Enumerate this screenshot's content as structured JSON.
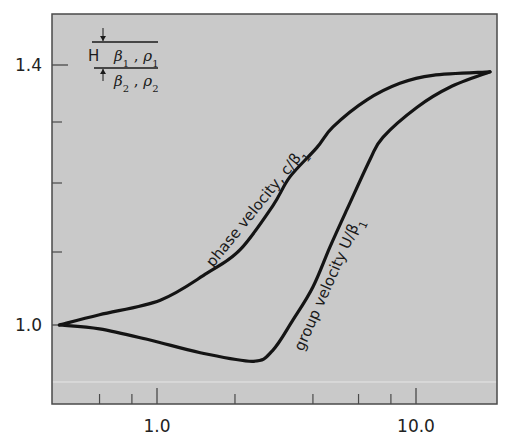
{
  "chart_data": {
    "type": "line",
    "title": "",
    "xlabel": "",
    "ylabel": "",
    "x_scale": "log",
    "xlim": [
      0.4,
      20
    ],
    "ylim": [
      0.9,
      1.45
    ],
    "grid": false,
    "legend": null,
    "x_ticks": {
      "major": [
        {
          "value": 1.0,
          "label": "1.0"
        },
        {
          "value": 10.0,
          "label": "10.0"
        }
      ],
      "minor": [
        0.6,
        0.8,
        2,
        4,
        6,
        8
      ]
    },
    "y_ticks": {
      "major": [
        {
          "value": 1.0,
          "label": "1.0"
        },
        {
          "value": 1.4,
          "label": "1.4"
        }
      ],
      "minor": [
        1.1,
        1.2,
        1.3
      ]
    },
    "series": [
      {
        "name": "phase velocity, c/β1",
        "label": "phase velocity, c/β₁",
        "x": [
          0.42,
          0.6,
          1.03,
          1.56,
          2.09,
          2.8,
          3.26,
          4.14,
          4.78,
          6.46,
          8.67,
          11.6,
          19.3
        ],
        "y": [
          1.0,
          1.014,
          1.034,
          1.071,
          1.103,
          1.167,
          1.21,
          1.258,
          1.292,
          1.339,
          1.368,
          1.382,
          1.388
        ]
      },
      {
        "name": "group velocity U/β1",
        "label": "group velocity U/β₁",
        "x": [
          0.42,
          0.6,
          0.94,
          1.47,
          2.35,
          2.8,
          3.35,
          4.0,
          4.65,
          5.42,
          6.64,
          7.45,
          10.1,
          13.5,
          19.3
        ],
        "y": [
          1.0,
          0.995,
          0.981,
          0.965,
          0.954,
          0.968,
          1.007,
          1.052,
          1.107,
          1.162,
          1.238,
          1.275,
          1.326,
          1.361,
          1.388
        ]
      }
    ],
    "annotations": [
      {
        "text": "phase velocity, c/β₁",
        "attached_to": "phase velocity, c/β1"
      },
      {
        "text": "group velocity U/β₁",
        "attached_to": "group velocity U/β1"
      }
    ],
    "inset": {
      "description": "layer over half-space",
      "thickness_label": "H",
      "upper_layer": "β₁ , ρ₁",
      "lower_halfspace": "β₂ , ρ₂"
    }
  },
  "colors": {
    "plot_background": "#c9c9c9",
    "frame": "#4a4a4a",
    "curve": "#141414",
    "text": "#1a1a1a"
  },
  "labels": {
    "phase": "phase velocity, c/β",
    "phase_sub": "1",
    "group": "group velocity U/β",
    "group_sub": "1",
    "inset_H": "H",
    "inset_b1": "β",
    "inset_b1_sub": "1",
    "inset_sep1": " , ",
    "inset_r1": "ρ",
    "inset_r1_sub": "1",
    "inset_b2": "β",
    "inset_b2_sub": "2",
    "inset_sep2": " , ",
    "inset_r2": "ρ",
    "inset_r2_sub": "2"
  }
}
